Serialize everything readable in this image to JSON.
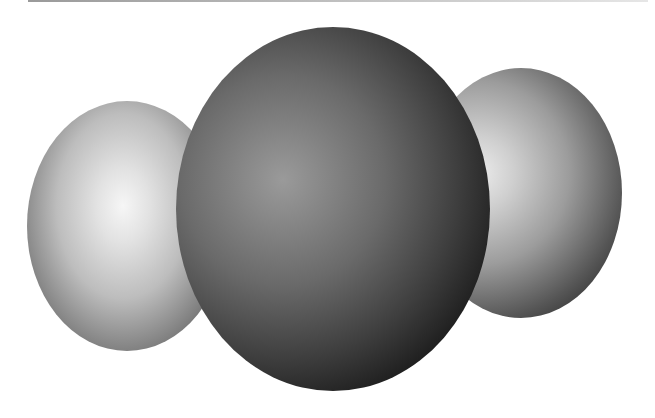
{
  "image": {
    "subject": "space-filling molecular model",
    "atoms": [
      {
        "name": "left-atom",
        "shade": "light-gray"
      },
      {
        "name": "center-atom",
        "shade": "dark-gray"
      },
      {
        "name": "right-atom",
        "shade": "light-gray"
      }
    ],
    "colors": {
      "background": "#ffffff",
      "light_atom_highlight": "#f6f6f6",
      "dark_atom_highlight": "#9a9a9a",
      "shadow": "#050505"
    }
  }
}
